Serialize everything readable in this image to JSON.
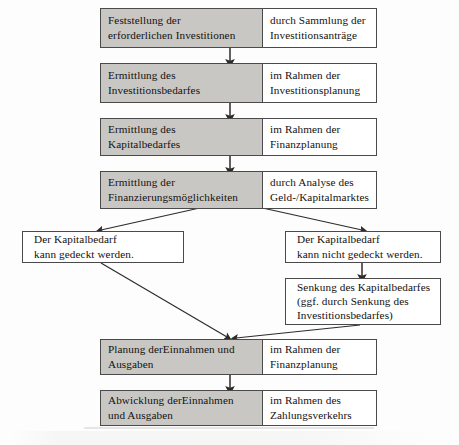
{
  "diagram": {
    "type": "flowchart",
    "background_color": "#fdfdfd",
    "process_fill_color": "#c9c7c3",
    "note_fill_color": "#ffffff",
    "line_color": "#4a4a4a",
    "text_color": "#14110f"
  },
  "nodes": {
    "step1": {
      "action": "Feststellung der\nerforderlichen Investitionen",
      "context": "durch Sammlung der\nInvestitionsanträge"
    },
    "step2": {
      "action": "Ermittlung des\nInvestitionsbedarfes",
      "context": "im Rahmen der\nInvestitionsplanung"
    },
    "step3": {
      "action": "Ermittlung des\nKapitalbedarfes",
      "context": "im Rahmen der\nFinanzplanung"
    },
    "step4": {
      "action": "Ermittlung der\nFinanzierungsmöglichkeiten",
      "context": "durch Analyse des\nGeld-/Kapitalmarktes"
    },
    "branch_yes": {
      "text": "Der Kapitalbedarf\nkann gedeckt werden."
    },
    "branch_no": {
      "text": "Der Kapitalbedarf\nkann nicht gedeckt werden."
    },
    "reduction": {
      "text": "Senkung des Kapitalbedarfes\n(ggf. durch Senkung des\nInvestitionsbedarfes)"
    },
    "step5": {
      "action": "Planung derEinnahmen und\nAusgaben",
      "context": "im Rahmen der\nFinanzplanung"
    },
    "step6": {
      "action": "Abwicklung derEinnahmen\nund Ausgaben",
      "context": "im Rahmen des\nZahlungsverkehrs"
    }
  },
  "edges": [
    {
      "id": "e1",
      "from": "step1",
      "to": "step2",
      "kind": "vertical-arrow"
    },
    {
      "id": "e2",
      "from": "step2",
      "to": "step3",
      "kind": "vertical-arrow"
    },
    {
      "id": "e3",
      "from": "step3",
      "to": "step4",
      "kind": "vertical-arrow"
    },
    {
      "id": "e4",
      "from": "step4",
      "to": "branch_yes",
      "kind": "diagonal-arrow"
    },
    {
      "id": "e5",
      "from": "step4",
      "to": "branch_no",
      "kind": "diagonal-arrow"
    },
    {
      "id": "e6",
      "from": "branch_no",
      "to": "reduction",
      "kind": "vertical-arrow"
    },
    {
      "id": "e7",
      "from": "branch_yes",
      "to": "step5",
      "kind": "diagonal-arrow"
    },
    {
      "id": "e8",
      "from": "reduction",
      "to": "step5",
      "kind": "diagonal-arrow"
    },
    {
      "id": "e9",
      "from": "step5",
      "to": "step6",
      "kind": "vertical-arrow"
    }
  ]
}
